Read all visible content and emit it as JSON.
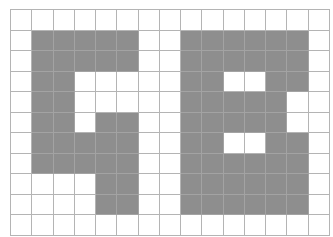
{
  "grid": {
    "cols": 15,
    "rows": 11,
    "colors": {
      "filled": "#8e8e8e",
      "empty": "#ffffff",
      "line": "#b4b4b4"
    },
    "cells": [
      "...............",
      ".#####..######.",
      ".#####..######.",
      ".##.....##..##.",
      ".##.....#####..",
      ".##.##..#####..",
      ".#####..##..##.",
      ".#####..######.",
      "....##..######.",
      "....##..######.",
      "..............."
    ]
  }
}
